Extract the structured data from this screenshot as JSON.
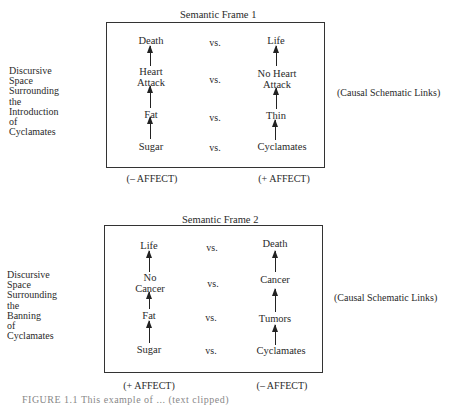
{
  "frames": [
    {
      "title": "Semantic Frame 1",
      "side_label": [
        "Discursive",
        "Space",
        "Surrounding",
        "the",
        "Introduction",
        "of",
        "Cyclamates"
      ],
      "right_label": "(Causal Schematic Links)",
      "rows": [
        {
          "left": [
            "Death"
          ],
          "vs": "vs.",
          "right": [
            "Life"
          ]
        },
        {
          "left": [
            "Heart",
            "Attack"
          ],
          "vs": "vs.",
          "right": [
            "No Heart",
            "Attack"
          ]
        },
        {
          "left": [
            "Fat"
          ],
          "vs": "vs.",
          "right": [
            "Thin"
          ]
        },
        {
          "left": [
            "Sugar"
          ],
          "vs": "vs.",
          "right": [
            "Cyclamates"
          ]
        }
      ],
      "affect_left": "(– AFFECT)",
      "affect_right": "(+ AFFECT)"
    },
    {
      "title": "Semantic Frame 2",
      "side_label": [
        "Discursive",
        "Space",
        "Surrounding",
        "the",
        "Banning",
        "of",
        "Cyclamates"
      ],
      "right_label": "(Causal Schematic Links)",
      "rows": [
        {
          "left": [
            "Life"
          ],
          "vs": "vs.",
          "right": [
            "Death"
          ]
        },
        {
          "left": [
            "No",
            "Cancer"
          ],
          "vs": "vs.",
          "right": [
            "Cancer"
          ]
        },
        {
          "left": [
            "Fat"
          ],
          "vs": "vs.",
          "right": [
            "Tumors"
          ]
        },
        {
          "left": [
            "Sugar"
          ],
          "vs": "vs.",
          "right": [
            "Cyclamates"
          ]
        }
      ],
      "affect_left": "(+ AFFECT)",
      "affect_right": "(– AFFECT)"
    }
  ],
  "caption": "FIGURE 1.1    This example of ... (text clipped)"
}
